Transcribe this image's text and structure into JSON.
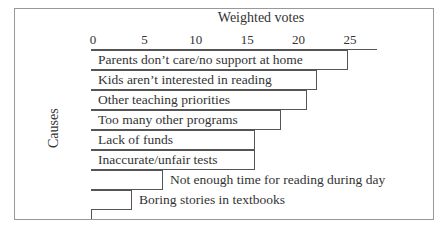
{
  "chart_data": {
    "type": "bar",
    "orientation": "horizontal",
    "title": "Weighted votes",
    "xlabel": "Weighted votes",
    "ylabel": "Causes",
    "xlim": [
      0,
      27
    ],
    "xticks": [
      "0",
      "5",
      "10",
      "15",
      "20",
      "25"
    ],
    "categories": [
      "Parents don’t care/no support at home",
      "Kids aren’t interested in reading",
      "Other teaching priorities",
      "Too many other programs",
      "Lack of funds",
      "Inaccurate/unfair tests",
      "Not enough time for reading during day",
      "Boring stories in textbooks"
    ],
    "values": [
      25,
      22,
      21,
      18.5,
      16,
      16,
      7,
      4
    ],
    "grid": false,
    "legend": null
  }
}
